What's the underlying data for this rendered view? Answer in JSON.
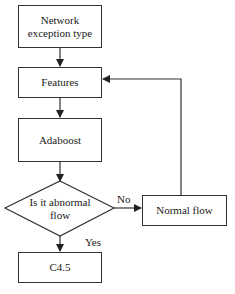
{
  "diagram": {
    "type": "flowchart",
    "nodes": [
      {
        "id": "n1",
        "label": "Network exception type",
        "shape": "rect"
      },
      {
        "id": "n2",
        "label": "Features",
        "shape": "rect"
      },
      {
        "id": "n3",
        "label": "Adaboost",
        "shape": "rect"
      },
      {
        "id": "n4",
        "label": "Is it abnormal flow",
        "shape": "diamond"
      },
      {
        "id": "n5",
        "label": "Normal flow",
        "shape": "rect"
      },
      {
        "id": "n6",
        "label": "C4.5",
        "shape": "rect"
      }
    ],
    "edges": [
      {
        "from": "n1",
        "to": "n2",
        "label": ""
      },
      {
        "from": "n2",
        "to": "n3",
        "label": ""
      },
      {
        "from": "n3",
        "to": "n4",
        "label": ""
      },
      {
        "from": "n4",
        "to": "n5",
        "label": "No"
      },
      {
        "from": "n4",
        "to": "n6",
        "label": "Yes"
      },
      {
        "from": "n5",
        "to": "n2",
        "label": ""
      }
    ],
    "labels": {
      "box1_line1": "Network",
      "box1_line2": "exception type",
      "features": "Features",
      "adaboost": "Adaboost",
      "decision_line1": "Is it abnormal",
      "decision_line2": "flow",
      "normal": "Normal flow",
      "c45": "C4.5",
      "no": "No",
      "yes": "Yes"
    },
    "colors": {
      "stroke": "#333333",
      "background": "#ffffff"
    }
  }
}
